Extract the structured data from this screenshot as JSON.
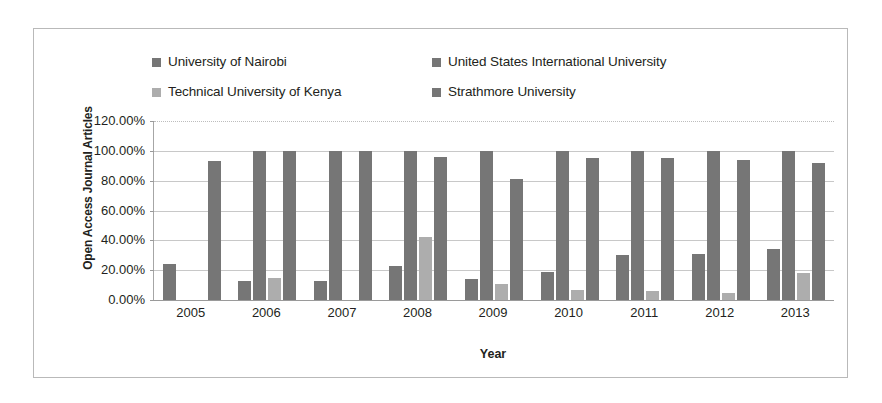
{
  "chart_data": {
    "type": "bar",
    "title": "",
    "xlabel": "Year",
    "ylabel": "Open Access Journal Articles",
    "categories": [
      "2005",
      "2006",
      "2007",
      "2008",
      "2009",
      "2010",
      "2011",
      "2012",
      "2013"
    ],
    "ylim": [
      0,
      120
    ],
    "ytick_labels": [
      "120.00%",
      "100.00%",
      "80.00%",
      "60.00%",
      "40.00%",
      "20.00%",
      "0.00%"
    ],
    "ytick_values": [
      120,
      100,
      80,
      60,
      40,
      20,
      0
    ],
    "grid": true,
    "legend_position": "top",
    "value_suffix": "%",
    "series": [
      {
        "name": "University of Nairobi",
        "color": "#767676",
        "values": [
          24,
          13,
          13,
          23,
          14,
          19,
          30,
          31,
          34
        ]
      },
      {
        "name": "United States International University",
        "color": "#767676",
        "values": [
          0,
          100,
          100,
          100,
          100,
          100,
          100,
          100,
          100
        ]
      },
      {
        "name": "Technical University of Kenya",
        "color": "#adadad",
        "values": [
          0,
          15,
          0,
          42,
          11,
          7,
          6,
          5,
          18
        ]
      },
      {
        "name": "Strathmore University",
        "color": "#767676",
        "values": [
          93,
          100,
          100,
          96,
          81,
          95,
          95,
          94,
          92
        ]
      }
    ]
  },
  "legend": {
    "entries": [
      {
        "label": "University of Nairobi",
        "color": "#767676"
      },
      {
        "label": "United States International University",
        "color": "#767676"
      },
      {
        "label": "Technical University of Kenya",
        "color": "#adadad"
      },
      {
        "label": "Strathmore University",
        "color": "#767676"
      }
    ]
  },
  "colors": {
    "bar_dark": "#767676",
    "bar_light": "#adadad",
    "gridline": "#c8c8c8",
    "frame_border": "#b9b9b9",
    "text": "#231f20"
  }
}
